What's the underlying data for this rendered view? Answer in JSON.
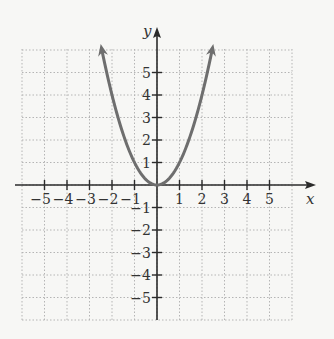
{
  "chart_data": {
    "type": "line",
    "title": "",
    "function": "y = x^2",
    "xlabel": "x",
    "ylabel": "y",
    "xlim": [
      -6,
      6
    ],
    "ylim": [
      -6,
      6
    ],
    "grid": true,
    "grid_style": "dotted",
    "x_ticks": [
      -5,
      -4,
      -3,
      -2,
      -1,
      1,
      2,
      3,
      4,
      5
    ],
    "y_ticks": [
      -5,
      -4,
      -3,
      -2,
      -1,
      1,
      2,
      3,
      4,
      5
    ],
    "x_tick_labels": [
      "−5",
      "−4",
      "−3",
      "−2",
      "−1",
      "1",
      "2",
      "3",
      "4",
      "5"
    ],
    "y_tick_labels": [
      "−5",
      "−4",
      "−3",
      "−2",
      "−1",
      "1",
      "2",
      "3",
      "4",
      "5"
    ],
    "series": [
      {
        "name": "parabola",
        "x": [
          -2.45,
          -2,
          -1.5,
          -1,
          -0.5,
          0,
          0.5,
          1,
          1.5,
          2,
          2.45
        ],
        "values": [
          6,
          4,
          2.25,
          1,
          0.25,
          0,
          0.25,
          1,
          2.25,
          4,
          6
        ],
        "arrows_at_ends": true
      }
    ],
    "colors": {
      "curve": "#6e6e6e",
      "axes": "#2b2b2b",
      "grid": "#b5b5b5",
      "background": "#f7f7f5"
    }
  }
}
